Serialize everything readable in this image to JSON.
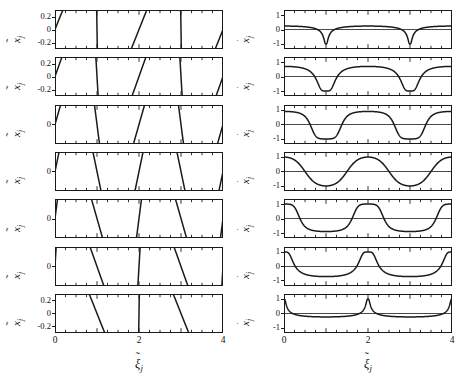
{
  "figure": {
    "kind": "multi-panel-line-plot-grid",
    "rows": 7,
    "columns": 2,
    "background_color": "#ffffff",
    "line_color": "#1a1a1a",
    "axis_color": "#1a1a1a"
  },
  "axes": {
    "x": {
      "label_base": "ξ",
      "label_accent": "˜",
      "label_sub": "j",
      "ticks": [
        "0",
        "2",
        "4"
      ],
      "tick_values": [
        0,
        2,
        4
      ],
      "minor_tick_step": 0.25,
      "range": [
        0,
        4
      ]
    },
    "y_left": {
      "label_base": "x",
      "label_accent": "˜",
      "label_sub": "j",
      "ticks": [
        "0.2",
        "0",
        "-0.2"
      ],
      "tick_values": [
        0.2,
        0,
        -0.2
      ],
      "range": [
        -0.3,
        0.3
      ]
    },
    "y_right": {
      "label_base": "x",
      "label_accent": "˙",
      "label_sub": "j",
      "ticks": [
        "1",
        "0",
        "-1"
      ],
      "tick_values": [
        1,
        0,
        -1
      ],
      "range": [
        -1.35,
        1.35
      ]
    }
  },
  "chart_data": {
    "type": "line",
    "title": "",
    "xlabel": "ξ̃_j",
    "ylabel": "x̃_j  /  ẋ̃_j",
    "grid": false,
    "legend": "none",
    "panel_grid": {
      "rows": 7,
      "cols": 2
    },
    "left_column": {
      "ylabel": "x̃_j",
      "ylim": [
        -0.3,
        0.3
      ],
      "xlim": [
        0,
        4
      ],
      "ytick_labels_shown_rows": [
        1,
        2,
        7
      ],
      "description": "Displacement waveform morphing from forward sawtooth (row 1) through sinusoid (row 4) to reversed sawtooth (row 7)",
      "panels": [
        {
          "row": 1,
          "skew": -0.93,
          "amplitude": 0.24,
          "peak_x": 0.3,
          "trough_x": 1.62,
          "ytick_labels": [
            "0.2",
            "0",
            "-0.2"
          ]
        },
        {
          "row": 2,
          "skew": -0.72,
          "amplitude": 0.27,
          "peak_x": 0.4,
          "trough_x": 1.55,
          "ytick_labels": [
            "0.2",
            "0",
            "-0.2"
          ]
        },
        {
          "row": 3,
          "skew": -0.38,
          "amplitude": 0.28,
          "peak_x": 0.46,
          "trough_x": 1.48,
          "ytick_labels": [
            "0"
          ]
        },
        {
          "row": 4,
          "skew": 0.0,
          "amplitude": 0.28,
          "peak_x": 0.5,
          "trough_x": 1.5,
          "ytick_labels": [
            "0"
          ]
        },
        {
          "row": 5,
          "skew": 0.38,
          "amplitude": 0.28,
          "peak_x": 0.55,
          "trough_x": 1.53,
          "ytick_labels": [
            "0"
          ]
        },
        {
          "row": 6,
          "skew": 0.72,
          "amplitude": 0.27,
          "peak_x": 0.62,
          "trough_x": 1.45,
          "ytick_labels": [
            "0"
          ]
        },
        {
          "row": 7,
          "skew": 0.93,
          "amplitude": 0.24,
          "peak_x": 0.76,
          "trough_x": 1.22,
          "ytick_labels": [
            "0.2",
            "0",
            "-0.2"
          ]
        }
      ]
    },
    "right_column": {
      "ylabel": "ẋ̃_j",
      "ylim": [
        -1.35,
        1.35
      ],
      "xlim": [
        0,
        4
      ],
      "ytick_labels_shown_rows": [
        1,
        2,
        3,
        4,
        5,
        6,
        7
      ],
      "description": "Velocity waveform: narrow positive spikes on a -1 plateau (row 1), smooth cosine (row 4), wide +1 plateau with narrow negative spikes (row 7)",
      "panels": [
        {
          "row": 1,
          "skew": -0.93,
          "amplitude": 1.0,
          "plateau_level": -1,
          "spike_sign": 1,
          "spike_centers": [
            0.0,
            2.0,
            4.0
          ],
          "ytick_labels": [
            "1",
            "0",
            "-1"
          ]
        },
        {
          "row": 2,
          "skew": -0.72,
          "amplitude": 1.0,
          "plateau_level": -1,
          "spike_sign": 1,
          "spike_centers": [
            0.0,
            2.0,
            4.0
          ],
          "ytick_labels": [
            "1",
            "0",
            "-1"
          ]
        },
        {
          "row": 3,
          "skew": -0.38,
          "amplitude": 1.0,
          "plateau_level": 0,
          "spike_sign": 1,
          "spike_centers": [
            0.0,
            2.0,
            4.0
          ],
          "ytick_labels": [
            "1",
            "0",
            "-1"
          ]
        },
        {
          "row": 4,
          "skew": 0.0,
          "amplitude": 1.0,
          "plateau_level": 0,
          "spike_sign": 1,
          "spike_centers": [
            0.0,
            2.0,
            4.0
          ],
          "ytick_labels": [
            "1",
            "0",
            "-1"
          ]
        },
        {
          "row": 5,
          "skew": 0.38,
          "amplitude": 1.0,
          "plateau_level": 0,
          "spike_sign": -1,
          "spike_centers": [
            1.0,
            3.0
          ],
          "ytick_labels": [
            "1",
            "0",
            "-1"
          ]
        },
        {
          "row": 6,
          "skew": 0.72,
          "amplitude": 1.0,
          "plateau_level": 1,
          "spike_sign": -1,
          "spike_centers": [
            1.0,
            3.0
          ],
          "ytick_labels": [
            "1",
            "0",
            "-1"
          ]
        },
        {
          "row": 7,
          "skew": 0.93,
          "amplitude": 1.0,
          "plateau_level": 1,
          "spike_sign": -1,
          "spike_centers": [
            1.0,
            3.0
          ],
          "ytick_labels": [
            "1",
            "0",
            "-1"
          ]
        }
      ]
    }
  }
}
